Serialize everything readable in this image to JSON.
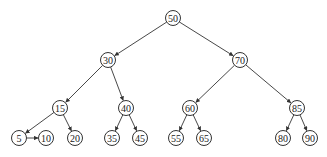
{
  "diagram": {
    "type": "binary-search-tree",
    "nodes": [
      {
        "id": "n50",
        "label": "50",
        "x": 173,
        "y": 18
      },
      {
        "id": "n30",
        "label": "30",
        "x": 108,
        "y": 60
      },
      {
        "id": "n70",
        "label": "70",
        "x": 240,
        "y": 60
      },
      {
        "id": "n15",
        "label": "15",
        "x": 60,
        "y": 108
      },
      {
        "id": "n40",
        "label": "40",
        "x": 126,
        "y": 108
      },
      {
        "id": "n60",
        "label": "60",
        "x": 190,
        "y": 108
      },
      {
        "id": "n85",
        "label": "85",
        "x": 297,
        "y": 108
      },
      {
        "id": "n5",
        "label": "5",
        "x": 19,
        "y": 138
      },
      {
        "id": "n10",
        "label": "10",
        "x": 46,
        "y": 138
      },
      {
        "id": "n20",
        "label": "20",
        "x": 75,
        "y": 138
      },
      {
        "id": "n35",
        "label": "35",
        "x": 112,
        "y": 138
      },
      {
        "id": "n45",
        "label": "45",
        "x": 140,
        "y": 138
      },
      {
        "id": "n55",
        "label": "55",
        "x": 176,
        "y": 138
      },
      {
        "id": "n65",
        "label": "65",
        "x": 204,
        "y": 138
      },
      {
        "id": "n80",
        "label": "80",
        "x": 283,
        "y": 138
      },
      {
        "id": "n90",
        "label": "90",
        "x": 310,
        "y": 138
      }
    ],
    "edges": [
      {
        "from": "n50",
        "to": "n30"
      },
      {
        "from": "n50",
        "to": "n70"
      },
      {
        "from": "n30",
        "to": "n15"
      },
      {
        "from": "n30",
        "to": "n40"
      },
      {
        "from": "n70",
        "to": "n60"
      },
      {
        "from": "n70",
        "to": "n85"
      },
      {
        "from": "n15",
        "to": "n5"
      },
      {
        "from": "n15",
        "to": "n20"
      },
      {
        "from": "n5",
        "to": "n10"
      },
      {
        "from": "n40",
        "to": "n35"
      },
      {
        "from": "n40",
        "to": "n45"
      },
      {
        "from": "n60",
        "to": "n55"
      },
      {
        "from": "n60",
        "to": "n65"
      },
      {
        "from": "n85",
        "to": "n80"
      },
      {
        "from": "n85",
        "to": "n90"
      }
    ],
    "node_radius": 7.5,
    "colors": {
      "stroke": "#333333",
      "fill": "#ffffff",
      "text": "#222222"
    }
  }
}
